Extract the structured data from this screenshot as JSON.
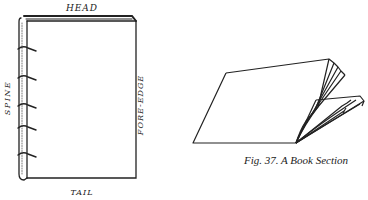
{
  "figure": {
    "caption": "Fig. 37.  A Book Section",
    "colors": {
      "ink": "#222222",
      "paper": "#ffffff"
    }
  },
  "book_anatomy": {
    "labels": {
      "head": "HEAD",
      "tail": "TAIL",
      "spine": "SPINE",
      "fore_edge": "FORE-EDGE"
    },
    "spine_bands": 5
  }
}
